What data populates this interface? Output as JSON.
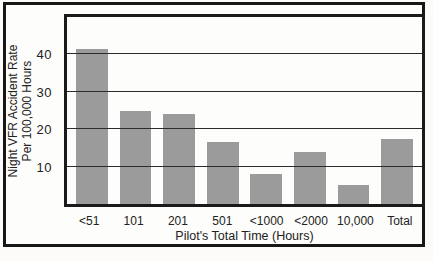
{
  "chart_data": {
    "type": "bar",
    "title": "",
    "categories": [
      "<51",
      "101",
      "201",
      "501",
      "<1000",
      "<2000",
      "10,000",
      "Total"
    ],
    "values": [
      41.5,
      25,
      24,
      16.5,
      8,
      14,
      5,
      17.5
    ],
    "xlabel": "Pilot's Total Time (Hours)",
    "ylabel": "Night VFR Accident Rate Per 100,000 Hours",
    "ylabel_lines": [
      "Night VFR Accident Rate",
      "Per 100,000 Hours"
    ],
    "ylim": [
      0,
      50
    ],
    "yticks": [
      10,
      20,
      30,
      40
    ],
    "grid": true,
    "legend_position": "none",
    "bar_color": "#9b9b9b",
    "frame_color": "#171717",
    "gridline_color": "#2b2b2b",
    "background_color": "#fdfdfb"
  }
}
